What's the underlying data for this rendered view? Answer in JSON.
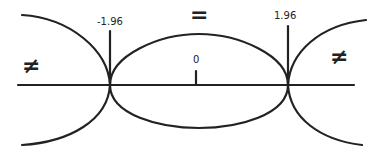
{
  "diagram": {
    "type": "two-tailed-test-regions",
    "axis": {
      "ticks": [
        {
          "label": "-1.96",
          "value": -1.96
        },
        {
          "label": "0",
          "value": 0
        },
        {
          "label": "1.96",
          "value": 1.96
        }
      ]
    },
    "regions": {
      "left": {
        "symbol": "≠"
      },
      "center": {
        "symbol": "="
      },
      "right": {
        "symbol": "≠"
      }
    },
    "colors": {
      "stroke": "#222222",
      "background": "#ffffff"
    }
  }
}
